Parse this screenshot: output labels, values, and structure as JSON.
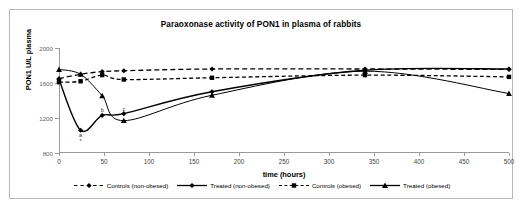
{
  "chart_data": {
    "type": "line",
    "title": "Paraoxonase activity of PON1 in plasma of rabbits",
    "xlabel": "time (hours)",
    "ylabel": "PON1 U/L plasma",
    "xlim": [
      0,
      500
    ],
    "ylim": [
      800,
      2000
    ],
    "xticks": [
      0,
      50,
      100,
      150,
      200,
      250,
      300,
      350,
      400,
      450,
      500
    ],
    "yticks": [
      800,
      1200,
      1600,
      2000
    ],
    "grid": false,
    "legend_position": "bottom",
    "series": [
      {
        "name": "Controls (non-obesed)",
        "marker": "diamond",
        "line": "dashed",
        "x": [
          0,
          24,
          48,
          72,
          170,
          340,
          500
        ],
        "values": [
          1650,
          1700,
          1730,
          1740,
          1760,
          1760,
          1755
        ]
      },
      {
        "name": "Treated (non-obesed)",
        "marker": "diamond",
        "line": "solid",
        "x": [
          0,
          24,
          48,
          72,
          170,
          340,
          500
        ],
        "values": [
          1640,
          1060,
          1230,
          1250,
          1500,
          1745,
          1760
        ]
      },
      {
        "name": "Controls (obesed)",
        "marker": "square",
        "line": "dashed",
        "x": [
          0,
          24,
          48,
          72,
          170,
          340,
          500
        ],
        "values": [
          1610,
          1620,
          1690,
          1640,
          1660,
          1690,
          1670
        ]
      },
      {
        "name": "Treated (obesed)",
        "marker": "triangle",
        "line": "solid",
        "x": [
          0,
          24,
          48,
          72,
          170,
          340,
          500
        ],
        "values": [
          1755,
          1700,
          1455,
          1170,
          1460,
          1735,
          1480
        ]
      }
    ],
    "annotations": [
      {
        "text": "a",
        "x": 24,
        "y": 1010
      },
      {
        "text": "*",
        "x": 24,
        "y": 940
      },
      {
        "text": "b",
        "x": 48,
        "y": 1290
      },
      {
        "text": "c",
        "x": 72,
        "y": 1300
      }
    ]
  },
  "legend": {
    "items": [
      {
        "label": "Controls (non-obesed)",
        "key": "dashed-diamond"
      },
      {
        "label": "Treated (non-obesed)",
        "key": "solid-diamond"
      },
      {
        "label": "Controls (obesed)",
        "key": "dashed-square"
      },
      {
        "label": "Treated (obesed)",
        "key": "solid-triangle"
      }
    ]
  },
  "colors": {
    "series": "#000000",
    "axis": "#9a9a9a",
    "frame": "#b9b9b9",
    "text": "#000000"
  }
}
